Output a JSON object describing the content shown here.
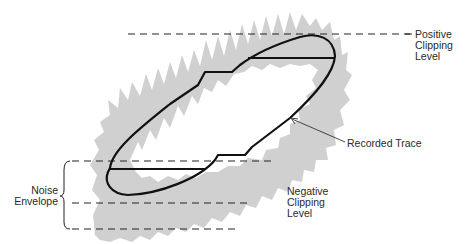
{
  "diagram": {
    "colors": {
      "background": "#ffffff",
      "noise": "#c8c8c8",
      "trace": "#111111",
      "dashed": "#222222",
      "text": "#2a2a2a"
    },
    "labels": {
      "positive_clipping": [
        "Positive",
        "Clipping",
        "Level"
      ],
      "negative_clipping": [
        "Negative",
        "Clipping",
        "Level"
      ],
      "recorded_trace": "Recorded Trace",
      "noise_envelope": [
        "Noise",
        "Envelope"
      ]
    }
  }
}
